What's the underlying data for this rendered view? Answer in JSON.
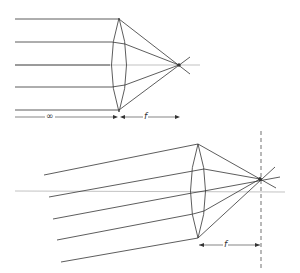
{
  "diagram": {
    "top_panel": {
      "description": "Parallel rays from infinity along the axis converge at the focal point",
      "object_distance_label": "∞",
      "focal_length_label": "f",
      "ray_count": 5
    },
    "bottom_panel": {
      "description": "Oblique parallel rays converge at a point on the focal plane",
      "focal_length_label": "f",
      "ray_count": 5,
      "focal_plane": "dashed vertical line"
    },
    "colors": {
      "line": "#333333",
      "axis": "#888888",
      "background": "#ffffff"
    }
  }
}
